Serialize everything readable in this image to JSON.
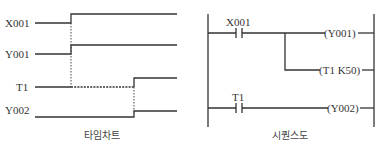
{
  "timing_chart": {
    "caption": "타임차트",
    "signals": [
      {
        "name": "X001",
        "on_at": "t0"
      },
      {
        "name": "Y001",
        "on_at": "t0"
      },
      {
        "name": "T1",
        "on_at": "t0 + delay",
        "delay_shown_as": "dashed segment"
      },
      {
        "name": "Y002",
        "on_at": "t0 + delay"
      }
    ]
  },
  "ladder": {
    "caption": "시퀀스도",
    "rungs": [
      {
        "contact": "X001",
        "outputs": [
          "(Y001)",
          "(T1 K50)"
        ]
      },
      {
        "contact": "T1",
        "outputs": [
          "(Y002)"
        ]
      }
    ]
  }
}
